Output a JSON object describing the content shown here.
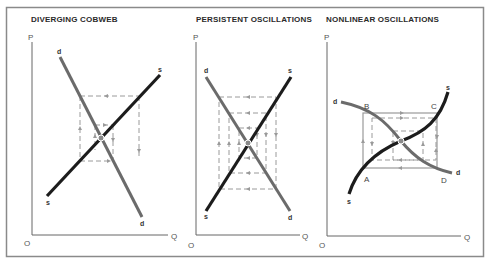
{
  "figure": {
    "panels": [
      {
        "id": "diverging",
        "title": "DIVERGING COBWEB",
        "axis": {
          "y_label": "P",
          "x_label": "Q",
          "origin_label": "O"
        },
        "curves": {
          "demand_label": "d",
          "supply_label": "s"
        }
      },
      {
        "id": "persistent",
        "title": "PERSISTENT OSCILLATIONS",
        "axis": {
          "y_label": "P",
          "x_label": "Q",
          "origin_label": "O"
        },
        "curves": {
          "demand_label": "d",
          "supply_label": "s"
        }
      },
      {
        "id": "nonlinear",
        "title": "NONLINEAR OSCILLATIONS",
        "axis": {
          "y_label": "P",
          "x_label": "Q",
          "origin_label": "O"
        },
        "curves": {
          "demand_label": "d",
          "supply_label": "s"
        },
        "points": {
          "a": "A",
          "b": "B",
          "c": "C",
          "d": "D"
        }
      }
    ],
    "colors": {
      "demand": "#6b6b6b",
      "supply": "#1c1c1c",
      "cobweb": "#9a9a9a",
      "frame": "#8a8a8a"
    }
  }
}
